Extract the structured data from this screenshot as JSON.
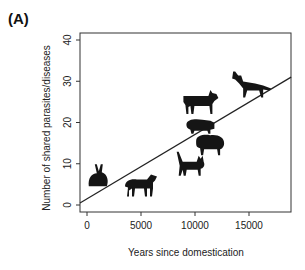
{
  "panel_label": "(A)",
  "chart_data": {
    "type": "scatter",
    "title": "",
    "xlabel": "Years since domestication",
    "ylabel": "Number of shared parasites/diseases",
    "xlim": [
      -650,
      18900
    ],
    "ylim": [
      -1.7,
      41.7
    ],
    "xticks": [
      0,
      5000,
      10000,
      15000
    ],
    "xtick_labels": [
      "0",
      "5000",
      "10000",
      "15000"
    ],
    "yticks": [
      0,
      10,
      20,
      30,
      40
    ],
    "ytick_labels": [
      "0",
      "10",
      "20",
      "30",
      "40"
    ],
    "grid": false,
    "legend": null,
    "marker_style": "animal silhouettes",
    "points": [
      {
        "label": "rabbit",
        "x": 1000,
        "y": 7
      },
      {
        "label": "horse",
        "x": 5000,
        "y": 5
      },
      {
        "label": "cat",
        "x": 9600,
        "y": 10
      },
      {
        "label": "sheep",
        "x": 11400,
        "y": 15
      },
      {
        "label": "pig",
        "x": 10500,
        "y": 19
      },
      {
        "label": "cattle",
        "x": 10500,
        "y": 25
      },
      {
        "label": "dog",
        "x": 15200,
        "y": 29
      }
    ],
    "regression_line": {
      "x": [
        -650,
        18900
      ],
      "y": [
        0.5,
        31
      ]
    }
  }
}
